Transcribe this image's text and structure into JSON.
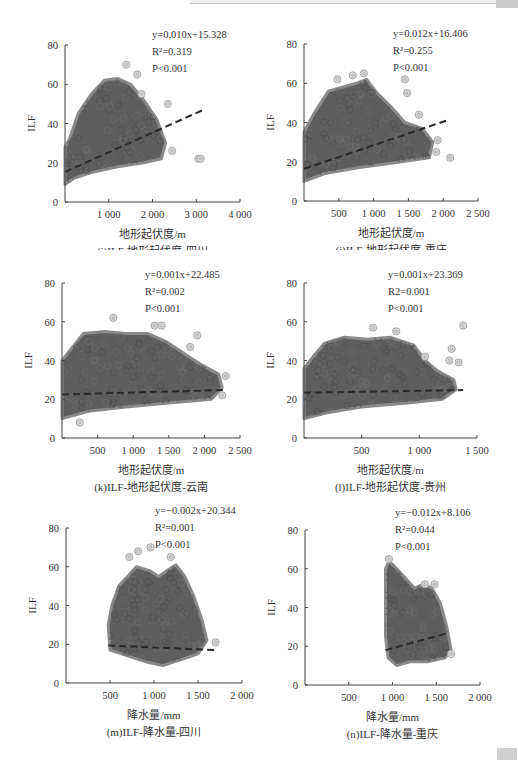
{
  "page": {
    "header_decor": "gray rule",
    "footer_decor": "gray tab"
  },
  "chart_data": [
    {
      "id": "i",
      "type": "scatter",
      "caption": "(i)ILF-地形起伏度-四川",
      "xlabel": "地形起伏度/m",
      "ylabel": "ILF",
      "xlim": [
        0,
        4000
      ],
      "ylim": [
        0,
        80
      ],
      "xticks": [
        1000,
        2000,
        3000,
        4000
      ],
      "xtick_labels": [
        "1 000",
        "2 000",
        "3 000",
        "4 000"
      ],
      "yticks": [
        0,
        20,
        40,
        60,
        80
      ],
      "annotation": {
        "equation": "y=0.010x+15.328",
        "r2": "R²=0.319",
        "p": "P<0.001"
      },
      "regression": {
        "slope": 0.01,
        "intercept": 15.328,
        "x_range": [
          0,
          3200
        ]
      },
      "cloud": {
        "upper": [
          [
            0,
            28
          ],
          [
            100,
            32
          ],
          [
            300,
            45
          ],
          [
            600,
            55
          ],
          [
            900,
            62
          ],
          [
            1200,
            63
          ],
          [
            1500,
            60
          ],
          [
            1800,
            52
          ],
          [
            2100,
            42
          ],
          [
            2300,
            30
          ],
          [
            2200,
            22
          ],
          [
            1800,
            20
          ],
          [
            1200,
            18
          ],
          [
            600,
            15
          ],
          [
            200,
            12
          ],
          [
            0,
            9
          ]
        ],
        "outliers": [
          [
            1400,
            70
          ],
          [
            1650,
            65
          ],
          [
            2350,
            50
          ],
          [
            2450,
            26
          ],
          [
            3050,
            22
          ],
          [
            3100,
            22
          ],
          [
            1750,
            55
          ]
        ]
      },
      "grid": false
    },
    {
      "id": "j",
      "type": "scatter",
      "caption": "(j)ILF-地形起伏度-重庆",
      "xlabel": "地形起伏度/m",
      "ylabel": "ILF",
      "xlim": [
        0,
        2500
      ],
      "ylim": [
        0,
        80
      ],
      "xticks": [
        500,
        1000,
        1500,
        2000,
        2500
      ],
      "xtick_labels": [
        "500",
        "1 000",
        "1 500",
        "2 000",
        "2 500"
      ],
      "yticks": [
        0,
        20,
        40,
        60,
        80
      ],
      "annotation": {
        "equation": "y=0.012x+16.406",
        "r2": "R²=0.255",
        "p": "P<0.001"
      },
      "regression": {
        "slope": 0.012,
        "intercept": 16.406,
        "x_range": [
          0,
          2050
        ]
      },
      "cloud": {
        "upper": [
          [
            0,
            35
          ],
          [
            150,
            45
          ],
          [
            350,
            56
          ],
          [
            550,
            58
          ],
          [
            750,
            60
          ],
          [
            900,
            62
          ],
          [
            1050,
            55
          ],
          [
            1250,
            48
          ],
          [
            1450,
            40
          ],
          [
            1700,
            37
          ],
          [
            1850,
            30
          ],
          [
            1800,
            22
          ],
          [
            1400,
            20
          ],
          [
            800,
            17
          ],
          [
            300,
            14
          ],
          [
            0,
            10
          ]
        ],
        "outliers": [
          [
            480,
            62
          ],
          [
            700,
            64
          ],
          [
            860,
            65
          ],
          [
            1450,
            62
          ],
          [
            1480,
            55
          ],
          [
            1650,
            44
          ],
          [
            1920,
            31
          ],
          [
            2100,
            22
          ],
          [
            1900,
            25
          ]
        ]
      },
      "grid": false
    },
    {
      "id": "k",
      "type": "scatter",
      "caption": "(k)ILF-地形起伏度-云南",
      "xlabel": "地形起伏度/m",
      "ylabel": "ILF",
      "xlim": [
        0,
        2500
      ],
      "ylim": [
        0,
        80
      ],
      "xticks": [
        500,
        1000,
        1500,
        2000,
        2500
      ],
      "xtick_labels": [
        "500",
        "1 000",
        "1 500",
        "2 000",
        "2 500"
      ],
      "yticks": [
        0,
        20,
        40,
        60,
        80
      ],
      "annotation": {
        "equation": "y=0.001x+22.485",
        "r2": "R²=0.002",
        "p": "P<0.001"
      },
      "regression": {
        "slope": 0.001,
        "intercept": 22.485,
        "x_range": [
          0,
          2300
        ]
      },
      "cloud": {
        "upper": [
          [
            0,
            40
          ],
          [
            150,
            47
          ],
          [
            300,
            54
          ],
          [
            600,
            55
          ],
          [
            900,
            54
          ],
          [
            1200,
            54
          ],
          [
            1450,
            50
          ],
          [
            1700,
            44
          ],
          [
            1950,
            38
          ],
          [
            2200,
            33
          ],
          [
            2250,
            26
          ],
          [
            2100,
            20
          ],
          [
            1500,
            18
          ],
          [
            900,
            16
          ],
          [
            400,
            14
          ],
          [
            0,
            10
          ]
        ],
        "outliers": [
          [
            720,
            62
          ],
          [
            1300,
            58
          ],
          [
            1400,
            58
          ],
          [
            1900,
            53
          ],
          [
            1800,
            47
          ],
          [
            2300,
            32
          ],
          [
            2250,
            22
          ],
          [
            250,
            8
          ]
        ]
      },
      "grid": false
    },
    {
      "id": "l",
      "type": "scatter",
      "caption": "(l)ILF-地形起伏度-贵州",
      "xlabel": "地形起伏度/m",
      "ylabel": "ILF",
      "xlim": [
        0,
        1500
      ],
      "ylim": [
        0,
        80
      ],
      "xticks": [
        500,
        1000,
        1500
      ],
      "xtick_labels": [
        "500",
        "1 000",
        "1 500"
      ],
      "yticks": [
        0,
        20,
        40,
        60,
        80
      ],
      "annotation": {
        "equation": "y=0.001x+23.369",
        "r2": "R2=0.001",
        "p": "P<0.001"
      },
      "regression": {
        "slope": 0.001,
        "intercept": 23.369,
        "x_range": [
          0,
          1380
        ]
      },
      "cloud": {
        "upper": [
          [
            0,
            36
          ],
          [
            80,
            42
          ],
          [
            180,
            49
          ],
          [
            350,
            52
          ],
          [
            550,
            51
          ],
          [
            750,
            52
          ],
          [
            950,
            48
          ],
          [
            1050,
            40
          ],
          [
            1150,
            35
          ],
          [
            1300,
            30
          ],
          [
            1320,
            25
          ],
          [
            1200,
            20
          ],
          [
            900,
            18
          ],
          [
            500,
            16
          ],
          [
            200,
            13
          ],
          [
            0,
            10
          ]
        ],
        "outliers": [
          [
            600,
            57
          ],
          [
            800,
            55
          ],
          [
            1380,
            58
          ],
          [
            1280,
            46
          ],
          [
            1260,
            40
          ],
          [
            1340,
            39
          ],
          [
            1050,
            42
          ]
        ]
      },
      "grid": false
    },
    {
      "id": "m",
      "type": "scatter",
      "caption": "(m)ILF-降水量-四川",
      "xlabel": "降水量/mm",
      "ylabel": "ILF",
      "xlim": [
        0,
        2000
      ],
      "ylim": [
        0,
        80
      ],
      "xticks": [
        500,
        1000,
        1500,
        2000
      ],
      "xtick_labels": [
        "500",
        "1 000",
        "1 500",
        "2 000"
      ],
      "yticks": [
        0,
        20,
        40,
        60,
        80
      ],
      "annotation": {
        "equation": "y=−0.002x+20.344",
        "r2": "R²=0.001",
        "p": "P<0.001"
      },
      "regression": {
        "slope": -0.002,
        "intercept": 20.344,
        "x_range": [
          480,
          1700
        ]
      },
      "cloud": {
        "upper": [
          [
            480,
            30
          ],
          [
            520,
            40
          ],
          [
            600,
            50
          ],
          [
            700,
            55
          ],
          [
            800,
            60
          ],
          [
            950,
            58
          ],
          [
            1050,
            55
          ],
          [
            1150,
            58
          ],
          [
            1250,
            61
          ],
          [
            1350,
            55
          ],
          [
            1450,
            45
          ],
          [
            1550,
            32
          ],
          [
            1600,
            22
          ],
          [
            1500,
            15
          ],
          [
            1300,
            12
          ],
          [
            1100,
            9
          ],
          [
            900,
            11
          ],
          [
            700,
            14
          ],
          [
            500,
            17
          ]
        ],
        "outliers": [
          [
            720,
            65
          ],
          [
            820,
            68
          ],
          [
            960,
            70
          ],
          [
            1190,
            65
          ],
          [
            1700,
            21
          ]
        ]
      },
      "grid": false
    },
    {
      "id": "n",
      "type": "scatter",
      "caption": "(n)ILF-降水量-重庆",
      "xlabel": "降水量/mm",
      "ylabel": "ILF",
      "xlim": [
        0,
        2000
      ],
      "ylim": [
        0,
        80
      ],
      "xticks": [
        500,
        1000,
        1500,
        2000
      ],
      "xtick_labels": [
        "500",
        "1 000",
        "1 500",
        "2 000"
      ],
      "yticks": [
        0,
        20,
        40,
        60,
        80
      ],
      "annotation": {
        "equation": "y=−0.012x+8.106",
        "r2": "R²=0.044",
        "p": "P<0.001"
      },
      "regression": {
        "slope": 0.012,
        "intercept": 8.106,
        "plotted_range_y": [
          18,
          27
        ],
        "x_range": [
          920,
          1650
        ]
      },
      "cloud": {
        "upper": [
          [
            920,
            60
          ],
          [
            960,
            64
          ],
          [
            1050,
            60
          ],
          [
            1150,
            55
          ],
          [
            1250,
            50
          ],
          [
            1350,
            52
          ],
          [
            1450,
            50
          ],
          [
            1550,
            42
          ],
          [
            1620,
            30
          ],
          [
            1670,
            18
          ],
          [
            1600,
            14
          ],
          [
            1400,
            12
          ],
          [
            1200,
            12
          ],
          [
            1050,
            10
          ],
          [
            950,
            14
          ],
          [
            920,
            25
          ]
        ],
        "outliers": [
          [
            960,
            65
          ],
          [
            1370,
            52
          ],
          [
            1480,
            52
          ],
          [
            1670,
            16
          ]
        ]
      },
      "grid": false
    }
  ]
}
